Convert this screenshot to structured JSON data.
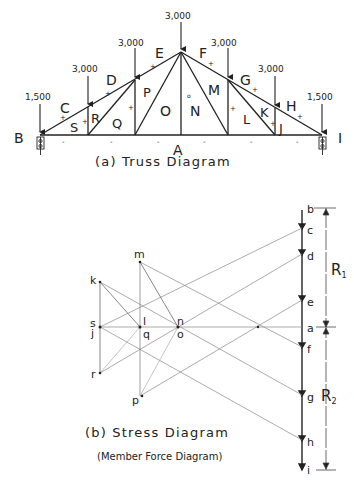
{
  "truss_diagram": {
    "caption": "(a) Truss Diagram",
    "loads": [
      {
        "label": "1,500",
        "position": "left-support"
      },
      {
        "label": "3,000",
        "position": "panel-point-1"
      },
      {
        "label": "3,000",
        "position": "panel-point-2"
      },
      {
        "label": "3,000",
        "position": "apex"
      },
      {
        "label": "3,000",
        "position": "panel-point-4"
      },
      {
        "label": "3,000",
        "position": "panel-point-5"
      },
      {
        "label": "1,500",
        "position": "right-support"
      }
    ],
    "support_labels": {
      "left": "B",
      "right": "I"
    },
    "space_labels": {
      "exterior_top": [
        "C",
        "D",
        "E",
        "F",
        "G",
        "H"
      ],
      "bottom": "A",
      "interior": [
        "S",
        "R",
        "Q",
        "P",
        "O",
        "N",
        "M",
        "L",
        "K",
        "J"
      ]
    },
    "sign_marks": {
      "top_chord": "+",
      "bottom_chord": "-",
      "center_vertical": "0"
    }
  },
  "stress_diagram": {
    "caption": "(b) Stress Diagram",
    "subcaption": "(Member Force Diagram)",
    "load_line_points": [
      "b",
      "c",
      "d",
      "e",
      "a",
      "f",
      "g",
      "h",
      "i"
    ],
    "interior_points": [
      "k",
      "s",
      "j",
      "l",
      "q",
      "n",
      "o",
      "m",
      "r",
      "p"
    ],
    "reactions": [
      "R1",
      "R2"
    ],
    "reaction_labels": {
      "R1": "R",
      "R1_sub": "1",
      "R2": "R",
      "R2_sub": "2"
    }
  }
}
